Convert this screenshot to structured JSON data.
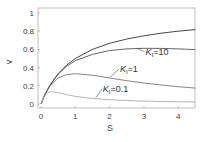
{
  "chart_data": {
    "type": "line",
    "title": "",
    "xlabel": "S",
    "ylabel": "v",
    "xlim": [
      -0.1,
      4.5
    ],
    "ylim": [
      -0.04,
      1.05
    ],
    "xticks": [
      0,
      1,
      2,
      3,
      4
    ],
    "xtick_labels": [
      "0",
      "1",
      "2",
      "3",
      "4"
    ],
    "yticks": [
      0,
      0.2,
      0.4,
      0.6,
      0.8,
      1
    ],
    "ytick_labels": [
      "0",
      "0.2",
      "0.4",
      "0.6",
      "0.8",
      "1"
    ],
    "grid": false,
    "legend": "none (inline curve labels)",
    "series": [
      {
        "name": "no inhibition",
        "label": "",
        "color": "#333333",
        "x": [
          0,
          0.1,
          0.25,
          0.5,
          0.75,
          1,
          1.5,
          2,
          2.5,
          3,
          3.5,
          4,
          4.5
        ],
        "y": [
          0,
          0.091,
          0.2,
          0.333,
          0.429,
          0.5,
          0.6,
          0.667,
          0.714,
          0.75,
          0.778,
          0.8,
          0.818
        ]
      },
      {
        "name": "KI=10",
        "label_main": "K",
        "label_sub": "I",
        "label_tail": "=10",
        "color": "#555555",
        "x": [
          0,
          0.1,
          0.25,
          0.5,
          0.75,
          1,
          1.5,
          2,
          2.5,
          3,
          3.5,
          4,
          4.5
        ],
        "y": [
          0,
          0.091,
          0.199,
          0.328,
          0.415,
          0.476,
          0.545,
          0.588,
          0.606,
          0.612,
          0.611,
          0.606,
          0.598
        ]
      },
      {
        "name": "KI=1",
        "label_main": "K",
        "label_sub": "I",
        "label_tail": "=1",
        "color": "#777777",
        "x": [
          0,
          0.1,
          0.25,
          0.5,
          0.75,
          1,
          1.5,
          2,
          2.5,
          3,
          3.5,
          4,
          4.5
        ],
        "y": [
          0,
          0.09,
          0.19,
          0.286,
          0.324,
          0.333,
          0.316,
          0.286,
          0.256,
          0.231,
          0.209,
          0.19,
          0.175
        ]
      },
      {
        "name": "KI=0.1",
        "label_main": "K",
        "label_sub": "I",
        "label_tail": "=0.1",
        "color": "#aaaaaa",
        "x": [
          0,
          0.1,
          0.2,
          0.3,
          0.5,
          0.75,
          1,
          1.5,
          2,
          2.5,
          3,
          3.5,
          4,
          4.5
        ],
        "y": [
          0,
          0.083,
          0.125,
          0.136,
          0.125,
          0.102,
          0.083,
          0.06,
          0.047,
          0.038,
          0.032,
          0.028,
          0.024,
          0.022
        ]
      }
    ],
    "annotations": [
      {
        "text": "KI=10",
        "x": 3.05,
        "y": 0.54,
        "arrow_to": [
          2.8,
          0.615
        ]
      },
      {
        "text": "KI=1",
        "x": 2.3,
        "y": 0.35,
        "arrow_to": [
          2.0,
          0.29
        ]
      },
      {
        "text": "KI=0.1",
        "x": 1.8,
        "y": 0.13,
        "arrow_to": [
          1.6,
          0.07
        ]
      }
    ]
  }
}
